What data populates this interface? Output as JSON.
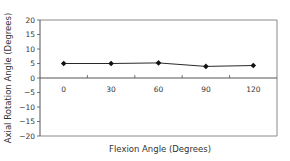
{
  "chart_data": {
    "type": "line",
    "title": "",
    "xlabel": "Flexion Angle (Degrees)",
    "ylabel": "Axial Rotation Angle (Degrees)",
    "categories": [
      "0",
      "30",
      "60",
      "90",
      "120"
    ],
    "series": [
      {
        "name": "Axial Rotation",
        "values": [
          5,
          5,
          5.2,
          4,
          4.3
        ],
        "marker": "diamond",
        "color": "#000000"
      }
    ],
    "ylim": [
      -20,
      20
    ],
    "yticks": [
      20,
      15,
      10,
      5,
      0,
      -5,
      -10,
      -15,
      -20
    ],
    "grid": false,
    "legend": null
  },
  "colors": {
    "frame": "#8a8a8a",
    "zero_line": "#555555",
    "series": "#111111",
    "text": "#333333"
  }
}
